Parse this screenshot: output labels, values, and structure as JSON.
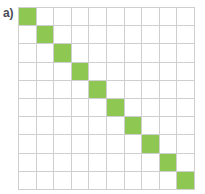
{
  "figure": {
    "panel_label": "a)",
    "label_color": "#4a4a55",
    "background_color": "#ffffff"
  },
  "chart_data": {
    "type": "heatmap",
    "title": "a)",
    "subtitle": "",
    "xlabel": "",
    "ylabel": "",
    "rows": 10,
    "cols": 10,
    "x": [
      1,
      2,
      3,
      4,
      5,
      6,
      7,
      8,
      9,
      10
    ],
    "y": [
      1,
      2,
      3,
      4,
      5,
      6,
      7,
      8,
      9,
      10
    ],
    "xticklabels": [],
    "yticklabels": [],
    "grid": true,
    "legend": "none",
    "colorscale": {
      "0": "#ffffff",
      "1": "#8ec751"
    },
    "gridline_color": "#cfcfcf",
    "values": [
      [
        1,
        0,
        0,
        0,
        0,
        0,
        0,
        0,
        0,
        0
      ],
      [
        0,
        1,
        0,
        0,
        0,
        0,
        0,
        0,
        0,
        0
      ],
      [
        0,
        0,
        1,
        0,
        0,
        0,
        0,
        0,
        0,
        0
      ],
      [
        0,
        0,
        0,
        1,
        0,
        0,
        0,
        0,
        0,
        0
      ],
      [
        0,
        0,
        0,
        0,
        1,
        0,
        0,
        0,
        0,
        0
      ],
      [
        0,
        0,
        0,
        0,
        0,
        1,
        0,
        0,
        0,
        0
      ],
      [
        0,
        0,
        0,
        0,
        0,
        0,
        1,
        0,
        0,
        0
      ],
      [
        0,
        0,
        0,
        0,
        0,
        0,
        0,
        1,
        0,
        0
      ],
      [
        0,
        0,
        0,
        0,
        0,
        0,
        0,
        0,
        1,
        0
      ],
      [
        0,
        0,
        0,
        0,
        0,
        0,
        0,
        0,
        0,
        1
      ]
    ]
  }
}
